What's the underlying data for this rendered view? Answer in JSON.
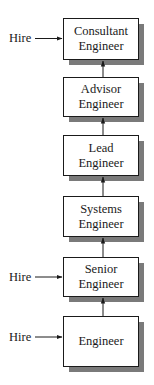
{
  "diagram": {
    "boxes": [
      {
        "id": "consultant",
        "line1": "Consultant",
        "line2": "Engineer"
      },
      {
        "id": "advisor",
        "line1": "Advisor",
        "line2": "Engineer"
      },
      {
        "id": "lead",
        "line1": "Lead",
        "line2": "Engineer"
      },
      {
        "id": "systems",
        "line1": "Systems",
        "line2": "Engineer"
      },
      {
        "id": "senior",
        "line1": "Senior",
        "line2": "Engineer"
      },
      {
        "id": "engineer",
        "line1": "Engineer",
        "line2": ""
      }
    ],
    "hire_entries": [
      {
        "label": "Hire",
        "target": "consultant"
      },
      {
        "label": "Hire",
        "target": "senior"
      },
      {
        "label": "Hire",
        "target": "engineer"
      }
    ],
    "colors": {
      "box_border": "#1a1a1a",
      "box_fill": "#ffffff",
      "shadow": "#7a7a7a",
      "arrow": "#1a1a1a"
    }
  }
}
